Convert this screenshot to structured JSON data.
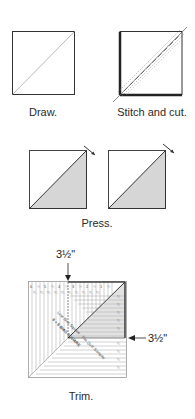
{
  "steps": [
    {
      "id": "draw",
      "caption": "Draw."
    },
    {
      "id": "stitch",
      "caption": "Stitch and cut."
    },
    {
      "id": "press",
      "caption": "Press."
    },
    {
      "id": "trim",
      "caption": "Trim."
    }
  ],
  "trim": {
    "top_dimension": "3½\"",
    "right_dimension": "3½\"",
    "ruler_top_labels": [
      "6",
      "½",
      "5",
      "½",
      "4",
      "½",
      "3",
      "½",
      "2",
      "½",
      "1",
      "½"
    ],
    "ruler_text_1": "6 × 6 BIAS SQUARE",
    "ruler_text_2": "Line Bias Square · The Quilt Sampler"
  },
  "colors": {
    "line": "#333333",
    "shade": "#d6d6d6",
    "dark_edge": "#444444",
    "ruler_line": "#9a9a9a"
  }
}
